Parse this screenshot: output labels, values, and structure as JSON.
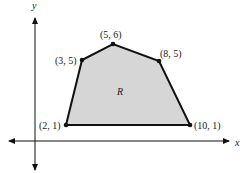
{
  "diagram": {
    "type": "polygon-region-on-axes",
    "axes": {
      "x_label": "x",
      "y_label": "y"
    },
    "region_label": "R",
    "region_fill": "#d6d6d6",
    "line_color": "#111111",
    "vertices": [
      {
        "x": 2,
        "y": 1,
        "label": "(2, 1)"
      },
      {
        "x": 3,
        "y": 5,
        "label": "(3, 5)"
      },
      {
        "x": 5,
        "y": 6,
        "label": "(5, 6)"
      },
      {
        "x": 8,
        "y": 5,
        "label": "(8, 5)"
      },
      {
        "x": 10,
        "y": 1,
        "label": "(10, 1)"
      }
    ]
  }
}
